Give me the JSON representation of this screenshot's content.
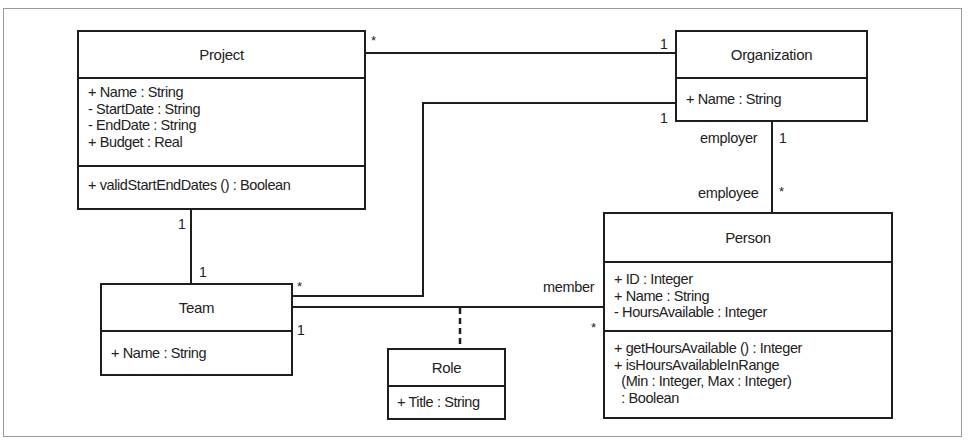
{
  "diagram": {
    "type": "uml-class-diagram",
    "classes": {
      "project": {
        "name": "Project",
        "attributes": [
          "+ Name : String",
          "- StartDate : String",
          "- EndDate : String",
          "+ Budget : Real"
        ],
        "operations": [
          "+ validStartEndDates () : Boolean"
        ]
      },
      "organization": {
        "name": "Organization",
        "attributes": [
          "+ Name : String"
        ]
      },
      "team": {
        "name": "Team",
        "attributes": [
          "+ Name : String"
        ]
      },
      "person": {
        "name": "Person",
        "attributes": [
          "+ ID : Integer",
          "+ Name : String",
          "- HoursAvailable : Integer"
        ],
        "operations": [
          "+ getHoursAvailable () : Integer",
          "+ isHoursAvailableInRange",
          "  (Min : Integer, Max : Integer)",
          "  : Boolean"
        ]
      },
      "role": {
        "name": "Role",
        "attributes": [
          "+ Title : String"
        ]
      }
    },
    "associations": {
      "project_organization": {
        "project_end": "*",
        "organization_end": "1"
      },
      "team_organization": {
        "team_end": "*",
        "organization_end": "1"
      },
      "organization_person": {
        "org_role": "employer",
        "org_mult": "1",
        "person_role": "employee",
        "person_mult": "*"
      },
      "project_team": {
        "project_end": "1",
        "team_end": "1"
      },
      "team_person": {
        "team_end": "1",
        "person_role": "member",
        "person_mult": "*",
        "association_class": "Role"
      }
    }
  }
}
